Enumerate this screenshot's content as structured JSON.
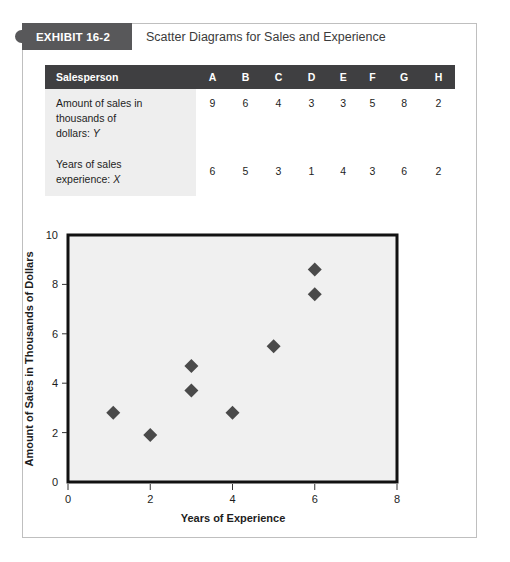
{
  "exhibit": {
    "tab_label": "EXHIBIT 16-2",
    "title": "Scatter Diagrams for Sales and Experience"
  },
  "table": {
    "header_label": "Salesperson",
    "columns": [
      "A",
      "B",
      "C",
      "D",
      "E",
      "F",
      "G",
      "H"
    ],
    "rows": [
      {
        "label_line1": "Amount of sales in",
        "label_line2": "thousands of",
        "label_line3": "dollars:",
        "label_var": "Y",
        "values": [
          "9",
          "6",
          "4",
          "3",
          "3",
          "5",
          "8",
          "2"
        ]
      },
      {
        "label_line1": "Years of sales",
        "label_line2": "experience:",
        "label_line3": "",
        "label_var": "X",
        "values": [
          "6",
          "5",
          "3",
          "1",
          "4",
          "3",
          "6",
          "2"
        ]
      }
    ]
  },
  "chart_data": {
    "type": "scatter",
    "title": "",
    "xlabel": "Years of Experience",
    "ylabel": "Amount of Sales in Thousands of Dollars",
    "xlim": [
      0,
      8
    ],
    "ylim": [
      0,
      10
    ],
    "xticks": [
      0,
      2,
      4,
      6,
      8
    ],
    "yticks": [
      0,
      2,
      4,
      6,
      8,
      10
    ],
    "xtick_labels": [
      "0",
      "2",
      "4",
      "6",
      "8"
    ],
    "ytick_labels": [
      "0",
      "2",
      "4",
      "6",
      "8",
      "10"
    ],
    "grid": false,
    "legend": "none",
    "marker": "diamond",
    "marker_color": "#4a4a4a",
    "plot_background": "#f0f0f0",
    "points": [
      {
        "x": 1.1,
        "y": 2.8
      },
      {
        "x": 2.0,
        "y": 1.9
      },
      {
        "x": 3.0,
        "y": 4.7
      },
      {
        "x": 3.0,
        "y": 3.7
      },
      {
        "x": 4.0,
        "y": 2.8
      },
      {
        "x": 5.0,
        "y": 5.5
      },
      {
        "x": 6.0,
        "y": 8.6
      },
      {
        "x": 6.0,
        "y": 7.6
      }
    ]
  }
}
